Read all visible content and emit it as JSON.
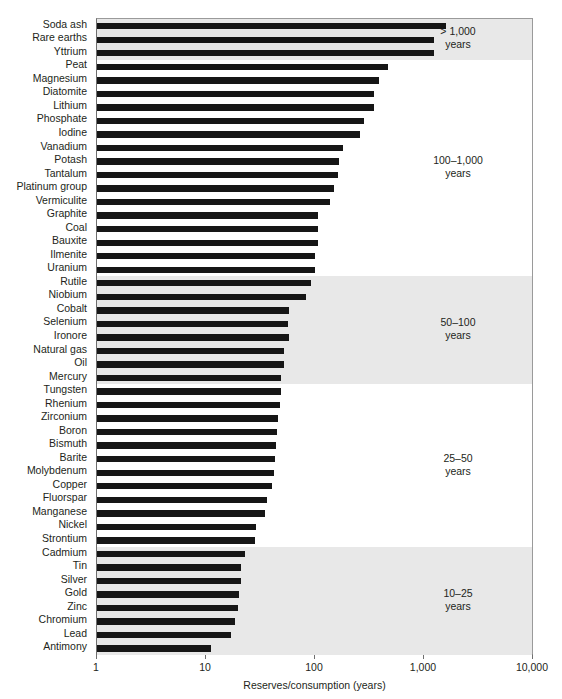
{
  "chart_data": {
    "type": "bar",
    "orientation": "horizontal",
    "title": "",
    "xlabel": "Reserves/consumption (years)",
    "ylabel": "",
    "xscale": "log",
    "xlim": [
      1,
      10000
    ],
    "xticks": [
      1,
      10,
      100,
      1000,
      10000
    ],
    "xtick_labels": [
      "1",
      "10",
      "100",
      "1,000",
      "10,000"
    ],
    "grid": false,
    "legend": "none",
    "bar_color": "#161616",
    "band_color": "#e8e8e8",
    "categories": [
      "Soda ash",
      "Rare earths",
      "Yttrium",
      "Peat",
      "Magnesium",
      "Diatomite",
      "Lithium",
      "Phosphate",
      "Iodine",
      "Vanadium",
      "Potash",
      "Tantalum",
      "Platinum group",
      "Vermiculite",
      "Graphite",
      "Coal",
      "Bauxite",
      "Ilmenite",
      "Uranium",
      "Rutile",
      "Niobium",
      "Cobalt",
      "Selenium",
      "Ironore",
      "Natural gas",
      "Oil",
      "Mercury",
      "Tungsten",
      "Rhenium",
      "Zirconium",
      "Boron",
      "Bismuth",
      "Barite",
      "Molybdenum",
      "Copper",
      "Fluorspar",
      "Manganese",
      "Nickel",
      "Strontium",
      "Cadmium",
      "Tin",
      "Silver",
      "Gold",
      "Zinc",
      "Chromium",
      "Lead",
      "Antimony"
    ],
    "values": [
      1600,
      1240,
      1240,
      470,
      385,
      350,
      350,
      280,
      260,
      180,
      166,
      163,
      150,
      138,
      107,
      107,
      106,
      101,
      100,
      92,
      83,
      58,
      57,
      58,
      52,
      52,
      49,
      49,
      48,
      46,
      45,
      44,
      43,
      42,
      40,
      36,
      35,
      29,
      28,
      23,
      21,
      21,
      20,
      19.5,
      18.5,
      17,
      11
    ],
    "annotations": [
      {
        "label": "> 1,000\nyears",
        "start_index": 0,
        "end_index": 2,
        "shaded": true
      },
      {
        "label": "100–1,000\nyears",
        "start_index": 3,
        "end_index": 18,
        "shaded": false
      },
      {
        "label": "50–100\nyears",
        "start_index": 19,
        "end_index": 26,
        "shaded": true
      },
      {
        "label": "25–50\nyears",
        "start_index": 27,
        "end_index": 38,
        "shaded": false
      },
      {
        "label": "10–25\nyears",
        "start_index": 39,
        "end_index": 46,
        "shaded": true
      }
    ]
  }
}
